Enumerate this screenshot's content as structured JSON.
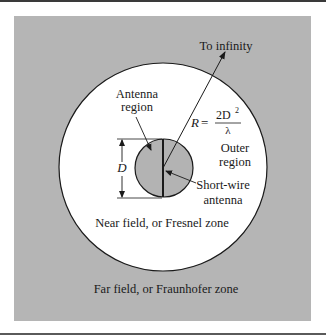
{
  "colors": {
    "panel_background": "#b5b5b5",
    "near_field": "#ffffff",
    "antenna_region": "#b3b3b3",
    "lines": "#1a1a1a"
  },
  "labels": {
    "to_infinity": "To infinity",
    "antenna_region_line1": "Antenna",
    "antenna_region_line2": "region",
    "radius_symbol": "R",
    "equals": "=",
    "formula_numerator": "2D",
    "formula_exponent": "2",
    "formula_denominator": "λ",
    "outer_region_line1": "Outer",
    "outer_region_line2": "region",
    "dimension_label": "D",
    "short_wire_line1": "Short-wire",
    "short_wire_line2": "antenna",
    "near_field": "Near field, or Fresnel zone",
    "far_field": "Far field, or Fraunhofer zone"
  }
}
